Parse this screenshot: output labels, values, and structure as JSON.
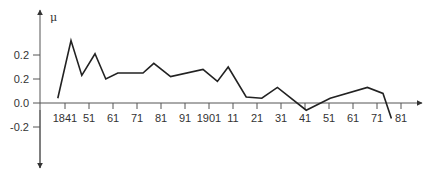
{
  "chart_data": {
    "type": "line",
    "title": "",
    "xlabel": "",
    "ylabel": "μ",
    "x_tick_labels": [
      "1841",
      "51",
      "61",
      "71",
      "81",
      "91",
      "1901",
      "11",
      "21",
      "31",
      "41",
      "51",
      "61",
      "71",
      "81"
    ],
    "x_tick_years": [
      1841,
      1851,
      1861,
      1871,
      1881,
      1891,
      1901,
      1911,
      1921,
      1931,
      1941,
      1951,
      1961,
      1971,
      1981
    ],
    "y_tick_labels": [
      "0.2",
      "0.2",
      "0.0",
      "-0.2"
    ],
    "y_tick_values": [
      0.4,
      0.2,
      0.0,
      -0.2
    ],
    "ylim": [
      -0.55,
      0.78
    ],
    "xlim": [
      1830,
      1988
    ],
    "grid": false,
    "legend": null,
    "series": [
      {
        "name": "μ",
        "color": "#222222",
        "x": [
          1838,
          1843.5,
          1848,
          1853.5,
          1858,
          1863,
          1873.5,
          1878,
          1885,
          1898.5,
          1904.5,
          1909,
          1916.5,
          1923,
          1929.5,
          1941.5,
          1951.5,
          1967,
          1973.5,
          1977
        ],
        "values": [
          0.04,
          0.52,
          0.23,
          0.41,
          0.2,
          0.25,
          0.25,
          0.33,
          0.22,
          0.28,
          0.18,
          0.3,
          0.05,
          0.04,
          0.13,
          -0.06,
          0.04,
          0.13,
          0.08,
          -0.13
        ]
      }
    ]
  },
  "colors": {
    "axis": "#555555",
    "line": "#222222",
    "text": "#333333"
  }
}
